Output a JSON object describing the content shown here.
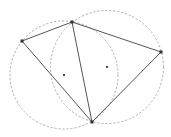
{
  "diagram": {
    "type": "delaunay-triangulation-with-circumcircles",
    "background": "#ffffff",
    "colors": {
      "edge": "#555555",
      "circle": "#9a9a9a",
      "vertex": "#333333",
      "center": "#222222"
    },
    "vertices": [
      {
        "id": "A",
        "x": 22,
        "y": 41
      },
      {
        "id": "B",
        "x": 72,
        "y": 22
      },
      {
        "id": "C",
        "x": 161,
        "y": 52
      },
      {
        "id": "D",
        "x": 92,
        "y": 122
      }
    ],
    "edges": [
      [
        "A",
        "B"
      ],
      [
        "B",
        "C"
      ],
      [
        "C",
        "D"
      ],
      [
        "D",
        "A"
      ],
      [
        "B",
        "D"
      ]
    ],
    "triangles": [
      {
        "vertices": [
          "A",
          "B",
          "D"
        ],
        "circumcenter": {
          "x": 64,
          "y": 75
        },
        "radius": 54
      },
      {
        "vertices": [
          "B",
          "C",
          "D"
        ],
        "circumcenter": {
          "x": 107,
          "y": 67
        },
        "radius": 56.5
      }
    ]
  }
}
